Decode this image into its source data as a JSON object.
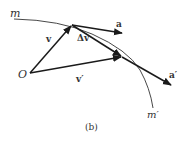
{
  "figure": {
    "caption": "(b)",
    "stroke_color": "#1a1a1a",
    "curve_color": "#333333",
    "labels": {
      "m": "m",
      "m_prime": "m′",
      "origin": "O",
      "v": "v",
      "v_prime": "v′",
      "delta_v": "Δv",
      "a": "a",
      "a_prime": "a′"
    }
  }
}
